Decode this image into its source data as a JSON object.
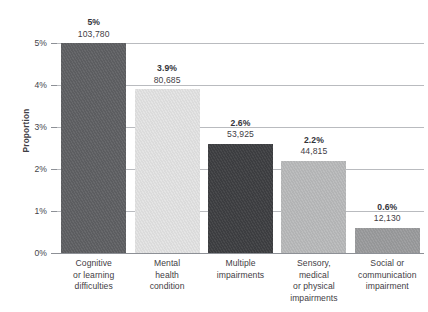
{
  "chart_data": {
    "type": "bar",
    "title": "",
    "subtitle": "",
    "xlabel": "",
    "ylabel": "Proportion",
    "ylim": [
      0,
      5
    ],
    "grid": true,
    "legend": "none",
    "orientation": "vertical",
    "y_tick_labels": [
      "0%",
      "1%",
      "2%",
      "3%",
      "4%",
      "5%"
    ],
    "y_tick_values": [
      0,
      1,
      2,
      3,
      4,
      5
    ],
    "categories": [
      "Cognitive or learning difficulties",
      "Mental health condition",
      "Multiple impairments",
      "Sensory, medical or physical impairments",
      "Social or communication impairment"
    ],
    "category_lines": [
      [
        "Cognitive",
        "or learning",
        "difficulties"
      ],
      [
        "Mental",
        "health",
        "condition"
      ],
      [
        "Multiple",
        "impairments"
      ],
      [
        "Sensory,",
        "medical",
        "or physical",
        "impairments"
      ],
      [
        "Social or",
        "communication",
        "impairment"
      ]
    ],
    "values": [
      5.0,
      3.9,
      2.6,
      2.2,
      0.6
    ],
    "value_labels": [
      "5%",
      "3.9%",
      "2.6%",
      "2.2%",
      "0.6%"
    ],
    "counts": [
      103780,
      80685,
      53925,
      44815,
      12130
    ],
    "count_labels": [
      "103,780",
      "80,685",
      "53,925",
      "44,815",
      "12,130"
    ],
    "bar_colors": [
      "#5f6063",
      "#e3e3e3",
      "#3e3f42",
      "#b9babb",
      "#9a9b9d"
    ]
  },
  "axis": {
    "y_title": "Proportion",
    "baseline_color": "#8d9096",
    "gridline_color": "#b9bbbf"
  },
  "footnote": {
    "text": ""
  }
}
